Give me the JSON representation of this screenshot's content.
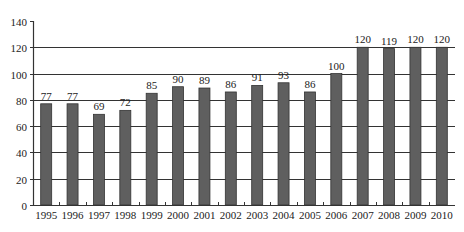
{
  "chart_data": {
    "type": "bar",
    "title": "",
    "xlabel": "",
    "ylabel": "",
    "ylim": [
      0,
      140
    ],
    "yticks": [
      0,
      20,
      40,
      60,
      80,
      100,
      120,
      140
    ],
    "grid": true,
    "legend": null,
    "categories": [
      "1995",
      "1996",
      "1997",
      "1998",
      "1999",
      "2000",
      "2001",
      "2002",
      "2003",
      "2004",
      "2005",
      "2006",
      "2007",
      "2008",
      "2009",
      "2010"
    ],
    "values": [
      77,
      77,
      69,
      72,
      85,
      90,
      89,
      86,
      91,
      93,
      86,
      100,
      120,
      119,
      120,
      120
    ],
    "data_labels": true,
    "colors": {
      "bar": "#5f5f5f",
      "bar_stroke": "#333333",
      "grid": "#333333",
      "axis": "#333333"
    }
  }
}
